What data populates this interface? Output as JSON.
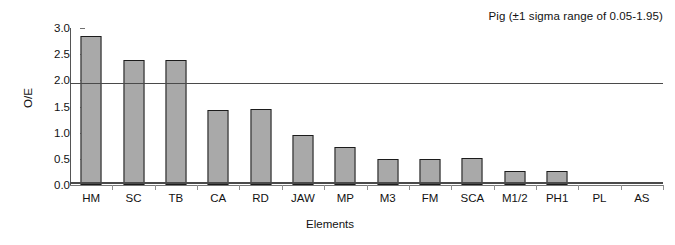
{
  "chart_data": {
    "type": "bar",
    "title": "Pig (±1 sigma range of 0.05-1.95)",
    "xlabel": "Elements",
    "ylabel": "O/E",
    "categories": [
      "HM",
      "SC",
      "TB",
      "CA",
      "RD",
      "JAW",
      "MP",
      "M3",
      "FM",
      "SCA",
      "M1/2",
      "PH1",
      "PL",
      "AS"
    ],
    "values": [
      2.85,
      2.38,
      2.38,
      1.44,
      1.45,
      0.96,
      0.73,
      0.5,
      0.5,
      0.51,
      0.26,
      0.27,
      0.0,
      0.0
    ],
    "ylim": [
      0.0,
      3.0
    ],
    "ytick_labels": [
      "0.0",
      "0.5",
      "1.0",
      "1.5",
      "2.0",
      "2.5",
      "3.0"
    ],
    "ytick_values": [
      0.0,
      0.5,
      1.0,
      1.5,
      2.0,
      2.5,
      3.0
    ],
    "grid": false,
    "legend": "none",
    "reference_lines": [
      {
        "name": "upper-sigma-line",
        "value": 1.95
      },
      {
        "name": "lower-sigma-line",
        "value": 0.05
      }
    ],
    "bar_color": "#a9a9a9",
    "bar_border_color": "#1c1c1c",
    "axis_color": "#555555",
    "reference_line_color": "#4a4a4a"
  }
}
